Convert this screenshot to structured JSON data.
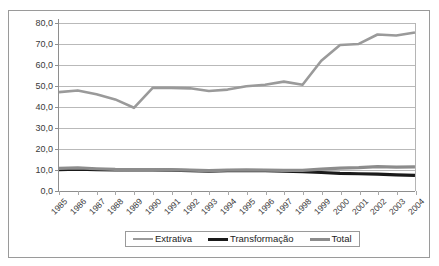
{
  "chart_data": {
    "type": "line",
    "title": "",
    "subtitle": "",
    "xlabel": "",
    "ylabel": "",
    "grid": true,
    "legend_position": "bottom",
    "ylim": [
      0.0,
      80.0
    ],
    "ytick_step": 10.0,
    "ytick_labels": [
      "0,0",
      "10,0",
      "20,0",
      "30,0",
      "40,0",
      "50,0",
      "60,0",
      "70,0",
      "80,0"
    ],
    "ytick_values": [
      0.0,
      10.0,
      20.0,
      30.0,
      40.0,
      50.0,
      60.0,
      70.0,
      80.0
    ],
    "categories": [
      "1985",
      "1986",
      "1987",
      "1988",
      "1989",
      "1990",
      "1991",
      "1992",
      "1993",
      "1994",
      "1995",
      "1996",
      "1997",
      "1998",
      "1999",
      "2000",
      "2001",
      "2002",
      "2003",
      "2004"
    ],
    "x": [
      1985,
      1986,
      1987,
      1988,
      1989,
      1990,
      1991,
      1992,
      1993,
      1994,
      1995,
      1996,
      1997,
      1998,
      1999,
      2000,
      2001,
      2002,
      2003,
      2004
    ],
    "series": [
      {
        "name": "Extrativa",
        "color": "#9a9a9a",
        "width": 2.6,
        "values": [
          47.0,
          47.8,
          46.0,
          43.5,
          39.5,
          49.0,
          49.0,
          48.8,
          47.5,
          48.2,
          49.8,
          50.5,
          52.0,
          50.5,
          62.0,
          69.5,
          70.0,
          74.5,
          74.0,
          75.5
        ]
      },
      {
        "name": "Transformação",
        "color": "#1a1a1a",
        "width": 3.2,
        "values": [
          10.0,
          10.2,
          10.0,
          9.8,
          9.8,
          9.8,
          9.7,
          9.5,
          9.3,
          9.5,
          9.6,
          9.5,
          9.2,
          9.0,
          8.6,
          8.2,
          8.0,
          7.8,
          7.5,
          7.2
        ]
      },
      {
        "name": "Total",
        "color": "#8c8c8c",
        "width": 3.2,
        "values": [
          10.6,
          10.8,
          10.4,
          10.1,
          10.0,
          10.0,
          9.9,
          9.7,
          9.5,
          9.7,
          9.8,
          9.7,
          9.6,
          9.6,
          10.2,
          10.7,
          10.9,
          11.4,
          11.2,
          11.3
        ]
      }
    ]
  },
  "legend": {
    "entries": [
      {
        "label": "Extrativa"
      },
      {
        "label": "Transformação"
      },
      {
        "label": "Total"
      }
    ]
  }
}
